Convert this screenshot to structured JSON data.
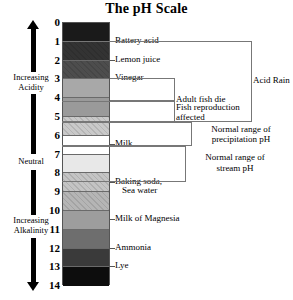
{
  "title": "The pH Scale",
  "axis": {
    "ticks": [
      "0",
      "1",
      "2",
      "3",
      "4",
      "5",
      "6",
      "7",
      "8",
      "9",
      "10",
      "11",
      "12",
      "13",
      "14"
    ]
  },
  "side_labels": {
    "acidity": {
      "line1": "Increasing",
      "line2": "Acidity"
    },
    "neutral": "Neutral",
    "alkalinity": {
      "line1": "Increasing",
      "line2": "Alkalinity"
    }
  },
  "substances": [
    {
      "label": "Battery acid",
      "ph": 1
    },
    {
      "label": "Lemon juice",
      "ph": 2
    },
    {
      "label": "Vinegar",
      "ph": 3
    },
    {
      "label": "Milk",
      "ph": 6.5
    },
    {
      "label": "Baking soda,",
      "ph": 8.5
    },
    {
      "label": "Sea water",
      "ph": 9
    },
    {
      "label": "Milk of Magnesia",
      "ph": 10.5
    },
    {
      "label": "Ammonia",
      "ph": 12
    },
    {
      "label": "Lye",
      "ph": 13
    }
  ],
  "brackets": [
    {
      "label": "Adult fish die",
      "from": 3,
      "to": 4.2
    },
    {
      "label_line1": "Fish reproduction",
      "label_line2": "affected",
      "from": 4.2,
      "to": 5.3
    },
    {
      "label_line1": "Normal range of",
      "label_line2": "precipitation pH",
      "from": 5.3,
      "to": 6.6
    },
    {
      "label_line1": "Normal range of",
      "label_line2": "stream pH",
      "from": 6.6,
      "to": 8.5
    },
    {
      "label": "Acid Rain",
      "from": 1,
      "to": 5.3
    }
  ],
  "bands": [
    {
      "ph": "0",
      "color": "#1a1a1a",
      "hatch": false
    },
    {
      "ph": "1",
      "color": "#333333",
      "hatch": true
    },
    {
      "ph": "2",
      "color": "#4d4d4d",
      "hatch": true
    },
    {
      "ph": "3",
      "color": "#a8a8a8",
      "hatch": false
    },
    {
      "ph": "4",
      "color": "#9a9a9a",
      "hatch": false
    },
    {
      "ph": "5",
      "color": "#c9c9c9",
      "hatch": true
    },
    {
      "ph": "6",
      "color": "#ffffff",
      "hatch": false
    },
    {
      "ph": "7",
      "color": "#e8e8e8",
      "hatch": false
    },
    {
      "ph": "8",
      "color": "#c4c4c4",
      "hatch": true
    },
    {
      "ph": "9",
      "color": "#b5b5b5",
      "hatch": true
    },
    {
      "ph": "10",
      "color": "#9d9d9d",
      "hatch": false
    },
    {
      "ph": "11",
      "color": "#6e6e6e",
      "hatch": false
    },
    {
      "ph": "12",
      "color": "#3a3a3a",
      "hatch": false
    },
    {
      "ph": "13",
      "color": "#0d0d0d",
      "hatch": false
    }
  ]
}
